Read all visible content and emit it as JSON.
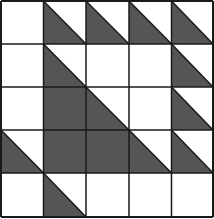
{
  "diagram": {
    "type": "quilt-grid",
    "rows": 5,
    "cols": 5,
    "colors": {
      "fill": "#555555",
      "line": "#1a1a1a",
      "background": "#ffffff"
    },
    "cell_legend": {
      "0": "empty",
      "1": "half-triangle (lower-left, diagonal top-left to bottom-right)",
      "2": "full-filled"
    },
    "cells": [
      [
        0,
        1,
        1,
        1,
        1
      ],
      [
        0,
        1,
        0,
        0,
        1
      ],
      [
        0,
        2,
        1,
        0,
        1
      ],
      [
        1,
        2,
        2,
        1,
        1
      ],
      [
        0,
        1,
        0,
        0,
        0
      ]
    ]
  }
}
